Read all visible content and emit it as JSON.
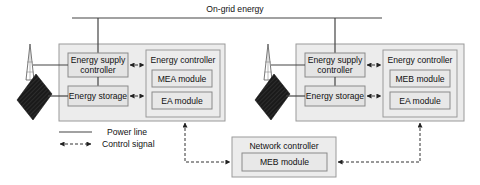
{
  "grid": {
    "label": "On-grid energy"
  },
  "microgrids": [
    {
      "supply_controller": [
        "Energy supply",
        "controller"
      ],
      "storage": "Energy storage",
      "energy_controller": {
        "title": "Energy controller",
        "module_top": "MEA module",
        "module_bottom": "EA module"
      },
      "icons": [
        "wind-turbine-icon",
        "solar-panel-icon"
      ]
    },
    {
      "supply_controller": [
        "Energy supply",
        "controller"
      ],
      "storage": "Energy storage",
      "energy_controller": {
        "title": "Energy controller",
        "module_top": "MEB module",
        "module_bottom": "EA module"
      },
      "icons": [
        "wind-turbine-icon",
        "solar-panel-icon"
      ]
    }
  ],
  "network_controller": {
    "title": "Network controller",
    "module": "MEB module"
  },
  "legend": {
    "items": [
      {
        "style": "solid",
        "label": "Power line"
      },
      {
        "style": "dashed-arrow",
        "label": "Control signal"
      }
    ]
  }
}
